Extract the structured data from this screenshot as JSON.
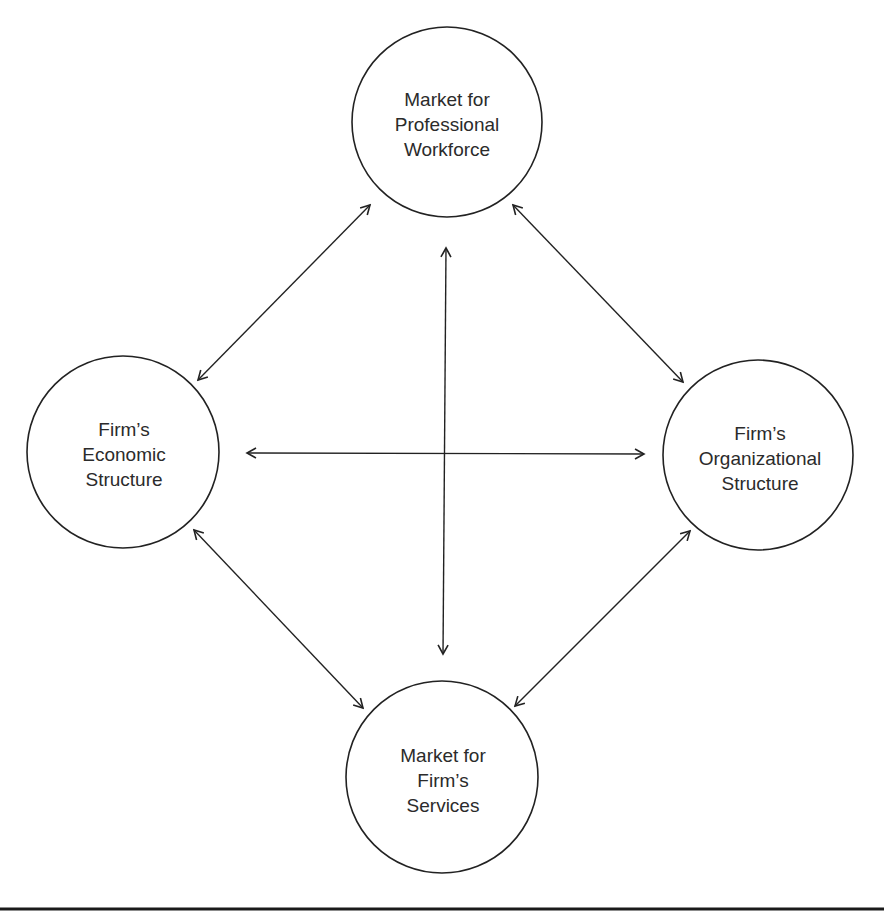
{
  "diagram": {
    "nodes": [
      {
        "id": "workforce",
        "lines": [
          "Market for",
          "Professional",
          "Workforce"
        ],
        "cx": 447,
        "cy": 122,
        "r": 95
      },
      {
        "id": "economic",
        "lines": [
          "Firm’s",
          "Economic",
          "Structure"
        ],
        "cx": 123,
        "cy": 452,
        "r": 96
      },
      {
        "id": "organizational",
        "lines": [
          "Firm’s",
          "Organizational",
          "Structure"
        ],
        "cx": 758,
        "cy": 455,
        "r": 95
      },
      {
        "id": "services",
        "lines": [
          "Market for",
          "Firm’s",
          "Services"
        ],
        "cx": 442,
        "cy": 777,
        "r": 96
      }
    ],
    "edges": [
      {
        "from": "economic",
        "to": "workforce",
        "type": "bidirectional"
      },
      {
        "from": "workforce",
        "to": "organizational",
        "type": "bidirectional"
      },
      {
        "from": "workforce",
        "to": "services",
        "type": "bidirectional"
      },
      {
        "from": "economic",
        "to": "organizational",
        "type": "bidirectional"
      },
      {
        "from": "economic",
        "to": "services",
        "type": "bidirectional"
      },
      {
        "from": "organizational",
        "to": "services",
        "type": "bidirectional"
      }
    ],
    "colors": {
      "stroke": "#222222",
      "text": "#2b2b2b",
      "background": "#ffffff"
    }
  }
}
